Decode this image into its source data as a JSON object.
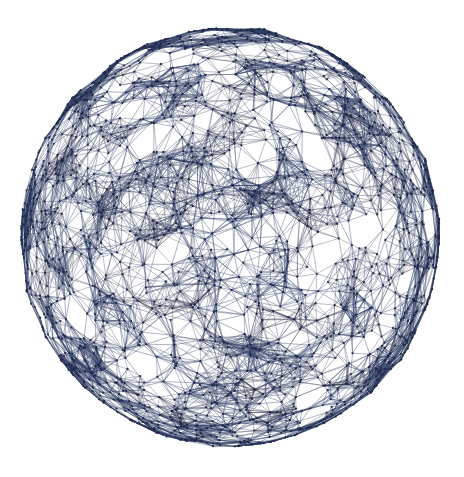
{
  "figure": {
    "type": "network-graph",
    "background_color": "#ffffff",
    "canvas": {
      "width": 464,
      "height": 477
    }
  },
  "chart_data": {
    "type": "scatter",
    "subtitle": "",
    "xlabel": "",
    "ylabel": "",
    "grid": false,
    "legend": null,
    "projection": "orthographic",
    "geometry": {
      "shape": "sphere",
      "center_x": 230,
      "center_y": 237,
      "radius": 209,
      "silhouette": "ragged-polygonal",
      "rim_wobble_px": 5
    },
    "nodes": {
      "count": 2000,
      "distribution": "uniform-on-sphere-surface",
      "radius_px": 1.15,
      "color": "#1e2749",
      "opacity": 0.85
    },
    "edges": {
      "count_approx": 9600,
      "rule": "connect-if-geodesic-distance-below-threshold",
      "threshold_ratio": 0.082,
      "color": "#2c3a5e",
      "width_px": 0.62,
      "opacity": 0.62
    },
    "appearance": {
      "density_gradient": "sparse-center-to-dense-rim",
      "rim_color": "#1b2342",
      "interior_color": "#33406a",
      "edge_accent_color": "#2c3a5e"
    },
    "xlim": [
      20,
      440
    ],
    "ylim": [
      28,
      446
    ]
  },
  "colors": {
    "background": "#ffffff",
    "edge": "#2c3a5e",
    "node": "#1e2749",
    "rim": "#1b2342"
  }
}
